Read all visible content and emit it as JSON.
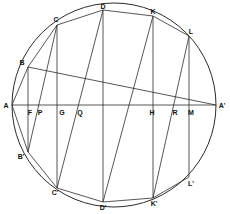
{
  "figure": {
    "type": "geometry-diagram",
    "stroke_color": "#2b2b2b",
    "background_color": "#ffffff",
    "circle": {
      "cx": 114,
      "cy": 105,
      "r": 102
    },
    "labels": [
      {
        "id": "A",
        "text": "A",
        "x": 6,
        "y": 105
      },
      {
        "id": "B",
        "text": "B",
        "x": 22,
        "y": 62
      },
      {
        "id": "C",
        "text": "C",
        "x": 56,
        "y": 19
      },
      {
        "id": "D",
        "text": "D",
        "x": 103,
        "y": 6
      },
      {
        "id": "K",
        "text": "K",
        "x": 153,
        "y": 11
      },
      {
        "id": "L",
        "text": "L",
        "x": 191,
        "y": 31
      },
      {
        "id": "Ap",
        "text": "A'",
        "x": 222,
        "y": 105
      },
      {
        "id": "F",
        "text": "F",
        "x": 30,
        "y": 112
      },
      {
        "id": "P",
        "text": "P",
        "x": 40,
        "y": 112
      },
      {
        "id": "G",
        "text": "G",
        "x": 62,
        "y": 112
      },
      {
        "id": "Q",
        "text": "Q",
        "x": 80,
        "y": 112
      },
      {
        "id": "H",
        "text": "H",
        "x": 152,
        "y": 112
      },
      {
        "id": "R",
        "text": "R",
        "x": 175,
        "y": 112
      },
      {
        "id": "M",
        "text": "M",
        "x": 191,
        "y": 112
      },
      {
        "id": "Bp",
        "text": "B'",
        "x": 21,
        "y": 156
      },
      {
        "id": "Cp",
        "text": "C'",
        "x": 55,
        "y": 192
      },
      {
        "id": "Dp",
        "text": "D'",
        "x": 103,
        "y": 207
      },
      {
        "id": "Kp",
        "text": "K'",
        "x": 154,
        "y": 203
      },
      {
        "id": "Lp",
        "text": "L'",
        "x": 191,
        "y": 183
      }
    ],
    "points": {
      "A": [
        12,
        105
      ],
      "Ap": [
        216,
        105
      ],
      "B": [
        28,
        67
      ],
      "Bp": [
        28,
        152
      ],
      "C": [
        57,
        25
      ],
      "Cp": [
        57,
        188
      ],
      "D": [
        103,
        10
      ],
      "Dp": [
        103,
        202
      ],
      "K": [
        153,
        16
      ],
      "Kp": [
        153,
        198
      ],
      "L": [
        189,
        36
      ],
      "Lp": [
        189,
        177
      ],
      "F": [
        30,
        105
      ],
      "P": [
        39,
        105
      ],
      "G": [
        62,
        105
      ],
      "Q": [
        80,
        105
      ],
      "H": [
        152,
        105
      ],
      "R": [
        175,
        105
      ],
      "M": [
        190,
        105
      ]
    },
    "segments": [
      {
        "name": "diameter-A-Ap",
        "from": "A",
        "to": "Ap"
      },
      {
        "name": "chord-B-Ap",
        "from": "B",
        "to": "Ap"
      },
      {
        "name": "vertical-B-Bp",
        "from": "B",
        "to": "Bp"
      },
      {
        "name": "vertical-C-Cp",
        "from": "C",
        "to": "Cp"
      },
      {
        "name": "vertical-D-Dp",
        "from": "D",
        "to": "Dp"
      },
      {
        "name": "vertical-K-Kp",
        "from": "K",
        "to": "Kp"
      },
      {
        "name": "vertical-L-Lp",
        "from": "L",
        "to": "Lp"
      },
      {
        "name": "chord-B-C",
        "from": "B",
        "to": "C"
      },
      {
        "name": "chord-C-D",
        "from": "C",
        "to": "D"
      },
      {
        "name": "chord-D-K",
        "from": "D",
        "to": "K"
      },
      {
        "name": "chord-K-L",
        "from": "K",
        "to": "L"
      },
      {
        "name": "chord-Bp-Cp",
        "from": "Bp",
        "to": "Cp"
      },
      {
        "name": "chord-Cp-Dp",
        "from": "Cp",
        "to": "Dp"
      },
      {
        "name": "chord-Dp-Kp",
        "from": "Dp",
        "to": "Kp"
      },
      {
        "name": "chord-Kp-Lp",
        "from": "Kp",
        "to": "Lp"
      },
      {
        "name": "slant-C-Bp",
        "from": "C",
        "to": "Bp"
      },
      {
        "name": "slant-D-Cp",
        "from": "D",
        "to": "Cp"
      },
      {
        "name": "slant-K-Dp",
        "from": "K",
        "to": "Dp"
      },
      {
        "name": "slant-L-Kp",
        "from": "L",
        "to": "Kp"
      },
      {
        "name": "slant-A-B",
        "from": "A",
        "to": "B"
      },
      {
        "name": "slant-A-Bp",
        "from": "A",
        "to": "Bp"
      }
    ]
  }
}
